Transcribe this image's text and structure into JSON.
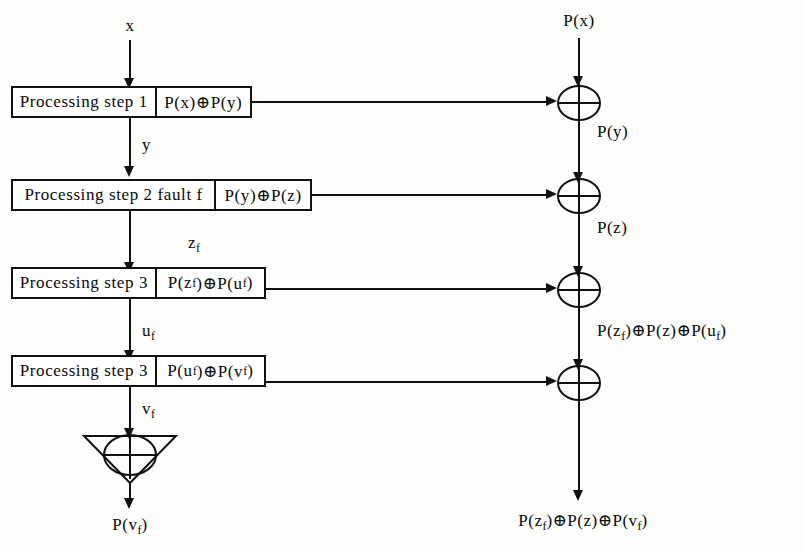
{
  "diagram": {
    "ink_color": "#111111",
    "background": "#fdfdfb"
  },
  "inputs": {
    "data_input_label": "x",
    "parity_input_label": "P(x)"
  },
  "rows": [
    {
      "step_label": "Processing step 1",
      "parity_label": "P(x)⊕P(y)",
      "data_out_label": "y",
      "parity_out_label": "P(y)",
      "xor_name": "xor-gate-1"
    },
    {
      "step_label": "Processing step 2  fault f",
      "parity_label": "P(y)⊕P(z)",
      "data_out_label": "z",
      "data_out_sub": "f",
      "parity_out_label": "P(z)",
      "xor_name": "xor-gate-2"
    },
    {
      "step_label": "Processing step 3",
      "parity_label": "P(z",
      "parity_label_sub1": "f",
      "parity_label_mid": ")⊕P(u",
      "parity_label_sub2": "f",
      "parity_label_end": ")",
      "data_out_label": "u",
      "data_out_sub": "f",
      "parity_out_label": "P(z",
      "xor_name": "xor-gate-3"
    },
    {
      "step_label": "Processing step 3",
      "parity_label": "P(u",
      "parity_label_sub1": "f",
      "parity_label_mid": ")⊕P(v",
      "parity_label_sub2": "f",
      "parity_label_end": ")",
      "data_out_label": "v",
      "data_out_sub": "f",
      "xor_name": "xor-gate-4"
    }
  ],
  "labels": {
    "step1_text": "Processing step 1",
    "step1_parity": "P(x)⊕P(y)",
    "step2_text": "Processing step 2  fault f",
    "step2_parity": "P(y)⊕P(z)",
    "step3a_text": "Processing step 3",
    "step3b_text": "Processing step 3",
    "edge_x": "x",
    "edge_y": "y",
    "edge_zf_base": "z",
    "edge_zf_sub": "f",
    "edge_uf_base": "u",
    "edge_uf_sub": "f",
    "edge_vf_base": "v",
    "edge_vf_sub": "f",
    "parity_in": "P(x)",
    "parity_y": "P(y)",
    "parity_z": "P(z)",
    "final_parity_left_base": "P(v",
    "final_parity_left_sub": "f",
    "final_parity_left_end": ")"
  },
  "formulas": {
    "step3a_parity_p1": "P(z",
    "step3a_parity_s1": "f",
    "step3a_parity_p2": ")⊕P(u",
    "step3a_parity_s2": "f",
    "step3a_parity_p3": ")",
    "step3b_parity_p1": "P(u",
    "step3b_parity_s1": "f",
    "step3b_parity_p2": ")⊕P(v",
    "step3b_parity_s2": "f",
    "step3b_parity_p3": ")",
    "mid_right_p1": "P(z",
    "mid_right_s1": "f",
    "mid_right_p2": ")⊕P(z)⊕P(u",
    "mid_right_s2": "f",
    "mid_right_p3": ")",
    "bottom_right_p1": "P(z",
    "bottom_right_s1": "f",
    "bottom_right_p2": ")⊕P(z)⊕P(v",
    "bottom_right_s2": "f",
    "bottom_right_p3": ")"
  },
  "symbols": {
    "xor_glyph": "⊕",
    "nabla_name": "nabla-xor-collector"
  }
}
